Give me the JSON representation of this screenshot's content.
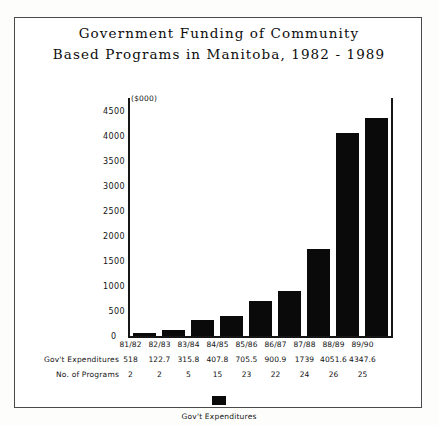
{
  "chart_data": {
    "type": "bar",
    "title": "Government Funding of Community Based Programs in Manitoba, 1982 - 1989",
    "title_lines": [
      "Government Funding of Community",
      "Based Programs in Manitoba, 1982 - 1989"
    ],
    "xlabel": "",
    "ylabel": "",
    "unit_label": "($000)",
    "categories": [
      "81/82",
      "82/83",
      "83/84",
      "84/85",
      "85/86",
      "86/87",
      "87/88",
      "88/89",
      "89/90"
    ],
    "values": [
      51.8,
      122.7,
      315.8,
      407.8,
      705.5,
      900.9,
      1739,
      4051.6,
      4347.6
    ],
    "value_labels": [
      "518",
      "122.7",
      "315.8",
      "407.8",
      "705.5",
      "900.9",
      "1739",
      "4051.6",
      "4347.6"
    ],
    "series": [
      {
        "name": "Gov't Expenditures",
        "values": [
          51.8,
          122.7,
          315.8,
          407.8,
          705.5,
          900.9,
          1739,
          4051.6,
          4347.6
        ]
      }
    ],
    "secondary_row": {
      "name": "No. of Programs",
      "values": [
        2,
        2,
        5,
        15,
        23,
        22,
        24,
        26,
        25
      ]
    },
    "ylim": [
      0,
      4750
    ],
    "yticks": [
      500,
      1000,
      1500,
      2000,
      2500,
      3000,
      3500,
      4000,
      4500
    ],
    "ytick_labels": [
      "500",
      "1000",
      "1500",
      "2000",
      "2500",
      "3000",
      "3500",
      "4000",
      "4500"
    ],
    "zero_label": "0",
    "grid": false,
    "legend": {
      "position": "bottom",
      "entries": [
        {
          "label": "Gov't Expenditures",
          "color": "#0a0a0a"
        }
      ]
    },
    "bar_color": "#0a0a0a"
  },
  "table": {
    "rows": [
      {
        "label": "",
        "cells": [
          "81/82",
          "82/83",
          "83/84",
          "84/85",
          "85/86",
          "86/87",
          "87/88",
          "88/89",
          "89/90"
        ]
      },
      {
        "label": "Gov't Expenditures",
        "cells": [
          "518",
          "122.7",
          "315.8",
          "407.8",
          "705.5",
          "900.9",
          "1739",
          "4051.6",
          "4347.6"
        ]
      },
      {
        "label": "No. of Programs",
        "cells": [
          "2",
          "2",
          "5",
          "15",
          "23",
          "22",
          "24",
          "26",
          "25"
        ]
      }
    ]
  },
  "colors": {
    "bar": "#0a0a0a",
    "axis": "#161616",
    "frame": "#4a4a4a",
    "text": "#121212",
    "background": "#ffffff"
  }
}
